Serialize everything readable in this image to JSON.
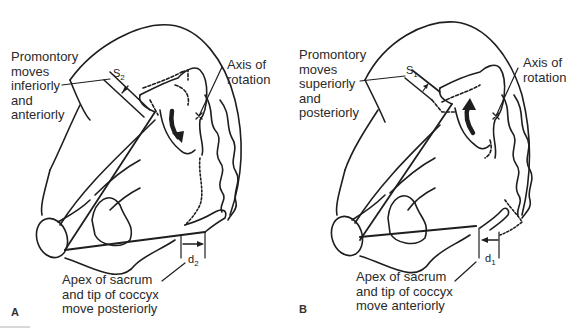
{
  "figure": {
    "panels": [
      {
        "letter": "A",
        "promontory_label": "Promontory\nmoves\ninferiorly\nand\nanteriorly",
        "axis_label": "Axis of\nrotation",
        "apex_label": "Apex of sacrum\nand tip of coccyx\nmove posteriorly",
        "s_symbol": "S",
        "s_subscript": "2",
        "d_symbol": "d",
        "d_subscript": "2",
        "rotation_direction": "clockwise-down"
      },
      {
        "letter": "B",
        "promontory_label": "Promontory\nmoves\nsuperiorly\nand\nposteriorly",
        "axis_label": "Axis of\nrotation",
        "apex_label": "Apex of sacrum\nand tip of coccyx\nmove anteriorly",
        "s_symbol": "S",
        "s_subscript": "1",
        "d_symbol": "d",
        "d_subscript": "1",
        "rotation_direction": "counterclockwise-up"
      }
    ],
    "colors": {
      "line": "#1e1e1e",
      "text": "#2a2a2a",
      "background": "#ffffff"
    }
  }
}
